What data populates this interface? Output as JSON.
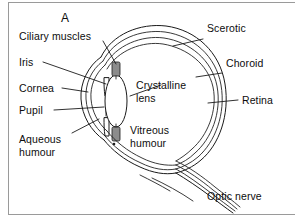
{
  "figure": {
    "panel_letter": "A",
    "background_color": "#ffffff",
    "ink_color": "#1a1a1a",
    "frame_color": "#9a9a9a",
    "muscle_fill_color": "#8c8c8c"
  },
  "labels": {
    "ciliary_muscles": "Ciliary muscles",
    "iris": "Iris",
    "cornea": "Cornea",
    "pupil": "Pupil",
    "aqueous_humour_line1": "Aqueous",
    "aqueous_humour_line2": "humour",
    "crystalline_lens_line1": "Crystalline",
    "crystalline_lens_line2": "lens",
    "vitreous_humour_line1": "Vitreous",
    "vitreous_humour_line2": "humour",
    "scerotic": "Scerotic",
    "choroid": "Choroid",
    "retina": "Retina",
    "optic_nerve": "Optic nerve"
  }
}
